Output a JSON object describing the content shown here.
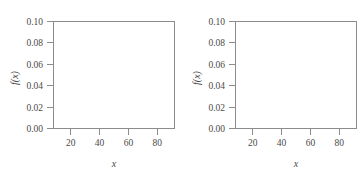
{
  "figure": {
    "title": "",
    "panel_count": 2
  },
  "chart_data": [
    {
      "type": "line",
      "title": "",
      "subtitle": "",
      "panel_id": "left",
      "xlabel": "x",
      "ylabel": "f(x)",
      "xlim": [
        8,
        92
      ],
      "ylim": [
        0.0,
        0.1
      ],
      "xticks": [
        20,
        40,
        60,
        80
      ],
      "xtick_labels": [
        "20",
        "40",
        "60",
        "80"
      ],
      "yticks": [
        0.0,
        0.02,
        0.04,
        0.06,
        0.08,
        0.1
      ],
      "ytick_labels": [
        "0.00",
        "0.02",
        "0.04",
        "0.06",
        "0.08",
        "0.10"
      ],
      "grid": false,
      "legend": null,
      "distribution": {
        "kind": "normal",
        "mean": 50,
        "sigma": 5,
        "peak_x": 50,
        "peak_y": 0.08
      },
      "shaded_region": {
        "from": 37,
        "to": 40,
        "color": "#9a9a9a",
        "label": ""
      },
      "series": [
        {
          "name": "f(x)",
          "x": [
            8,
            12,
            16,
            20,
            24,
            28,
            30,
            32,
            34,
            36,
            38,
            40,
            42,
            44,
            46,
            48,
            50,
            52,
            54,
            56,
            58,
            60,
            62,
            64,
            66,
            68,
            70,
            74,
            78,
            82,
            86,
            92
          ],
          "values": [
            0.0,
            0.0,
            0.0,
            0.0,
            0.0,
            0.0001,
            0.0004,
            0.0011,
            0.0027,
            0.0057,
            0.0108,
            0.0179,
            0.0258,
            0.0332,
            0.0372,
            0.0364,
            0.0318,
            0.0248,
            0.0173,
            0.0108,
            0.006,
            0.0029,
            0.0013,
            0.0005,
            0.0002,
            0.0001,
            0.0,
            0.0,
            0.0,
            0.0,
            0.0,
            0.0
          ]
        }
      ]
    },
    {
      "type": "line",
      "title": "",
      "subtitle": "",
      "panel_id": "right",
      "xlabel": "x",
      "ylabel": "f(x)",
      "xlim": [
        8,
        92
      ],
      "ylim": [
        0.0,
        0.1
      ],
      "xticks": [
        20,
        40,
        60,
        80
      ],
      "xtick_labels": [
        "20",
        "40",
        "60",
        "80"
      ],
      "yticks": [
        0.0,
        0.02,
        0.04,
        0.06,
        0.08,
        0.1
      ],
      "ytick_labels": [
        "0.00",
        "0.02",
        "0.04",
        "0.06",
        "0.08",
        "0.10"
      ],
      "grid": false,
      "legend": null,
      "distribution": {
        "kind": "normal",
        "mean": 50,
        "sigma": 15,
        "peak_x": 50,
        "peak_y": 0.027
      },
      "shaded_region": {
        "from": 30,
        "to": 40,
        "color": "#9a9a9a",
        "label": ""
      },
      "series": [
        {
          "name": "f(x)",
          "x": [
            8,
            12,
            16,
            20,
            24,
            28,
            30,
            34,
            38,
            40,
            44,
            46,
            50,
            54,
            58,
            60,
            62,
            66,
            70,
            74,
            78,
            82,
            86,
            92
          ],
          "values": [
            0.0008,
            0.0015,
            0.0026,
            0.0042,
            0.0066,
            0.0097,
            0.0114,
            0.0152,
            0.0193,
            0.0212,
            0.0249,
            0.0263,
            0.0266,
            0.0263,
            0.0249,
            0.0238,
            0.0224,
            0.0193,
            0.0152,
            0.0114,
            0.0079,
            0.005,
            0.003,
            0.0012
          ]
        }
      ]
    }
  ],
  "colors": {
    "curve": "#2b2b2b",
    "axis": "#8c8c8c",
    "text": "#4a4a4a",
    "shade": "#9a9a9a",
    "background": "#ffffff"
  }
}
